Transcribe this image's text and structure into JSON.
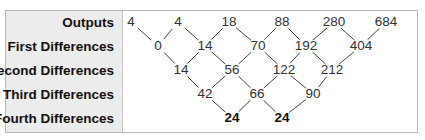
{
  "rows": [
    {
      "label": "Outputs",
      "y": 22,
      "values": [
        "4",
        "4",
        "18",
        "88",
        "280",
        "684"
      ],
      "xs": [
        131,
        178,
        229,
        282,
        334,
        386
      ],
      "bold": false
    },
    {
      "label": "First Differences",
      "y": 46,
      "values": [
        "0",
        "14",
        "70",
        "192",
        "404"
      ],
      "xs": [
        158,
        205,
        258,
        306,
        361
      ],
      "bold": false
    },
    {
      "label": "Second Differences",
      "y": 70,
      "values": [
        "14",
        "56",
        "122",
        "212"
      ],
      "xs": [
        181,
        232,
        284,
        332
      ],
      "bold": false
    },
    {
      "label": "Third Differences",
      "y": 94,
      "values": [
        "42",
        "66",
        "90"
      ],
      "xs": [
        205,
        257,
        313
      ],
      "bold": false
    },
    {
      "label": "Fourth Differences",
      "y": 118,
      "values": [
        "24",
        "24"
      ],
      "xs": [
        232,
        282
      ],
      "bold": true
    }
  ],
  "colors": {
    "line": "#444444",
    "label_bg": "#ececec",
    "border": "#b8b8b8"
  }
}
